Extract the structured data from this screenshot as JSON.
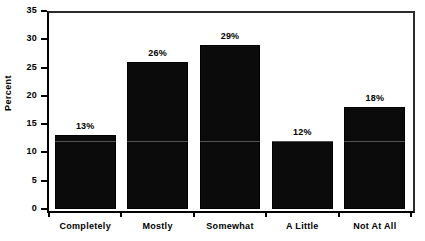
{
  "chart_data": {
    "type": "bar",
    "title": "",
    "xlabel": "",
    "ylabel": "Percent",
    "categories": [
      "Completely",
      "Mostly",
      "Somewhat",
      "A Little",
      "Not At All"
    ],
    "values": [
      13,
      26,
      29,
      12,
      18
    ],
    "value_labels": [
      "13%",
      "26%",
      "29%",
      "12%",
      "18%"
    ],
    "ylim": [
      0,
      35
    ],
    "ytick_values": [
      0,
      5,
      10,
      15,
      20,
      25,
      30,
      35
    ],
    "ytick_labels": [
      "0",
      "5",
      "10",
      "15",
      "20",
      "25",
      "30",
      "35"
    ],
    "grid": false,
    "legend": null,
    "bar_color": "#0b0b0b",
    "axis_color": "#000000",
    "background_color": "#ffffff"
  },
  "axes": {
    "y_title": "Percent"
  }
}
